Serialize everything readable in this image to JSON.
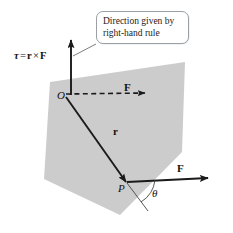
{
  "figure": {
    "plane_color": "#c9c9c9",
    "line_color": "#1a1a1a",
    "callout_border_color": "#9aa0a6"
  },
  "callout": {
    "line1": "Direction given by",
    "line2": "right-hand rule"
  },
  "equation": {
    "tau": "τ",
    "equals": "=",
    "r": "r",
    "cross": "×",
    "F": "F"
  },
  "labels": {
    "origin": "O",
    "point_p": "P",
    "r_vector": "r",
    "force_at_o": "F",
    "force_at_p": "F",
    "angle": "θ"
  }
}
